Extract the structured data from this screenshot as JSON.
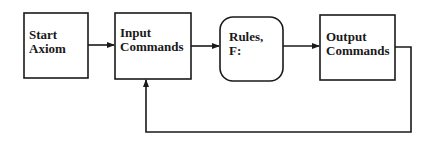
{
  "diagram": {
    "nodes": [
      {
        "id": "start",
        "lines": [
          "Start",
          "Axiom"
        ],
        "shape": "rect"
      },
      {
        "id": "input",
        "lines": [
          "Input",
          "Commands"
        ],
        "shape": "rect"
      },
      {
        "id": "rules",
        "lines": [
          "Rules,",
          "F:"
        ],
        "shape": "rounded-rect"
      },
      {
        "id": "output",
        "lines": [
          "Output",
          "Commands"
        ],
        "shape": "rect"
      }
    ],
    "edges": [
      {
        "from": "start",
        "to": "input"
      },
      {
        "from": "input",
        "to": "rules"
      },
      {
        "from": "rules",
        "to": "output"
      },
      {
        "from": "output",
        "to": "input",
        "type": "feedback"
      }
    ],
    "colors": {
      "stroke": "#1a1a1a",
      "background": "#ffffff"
    }
  }
}
